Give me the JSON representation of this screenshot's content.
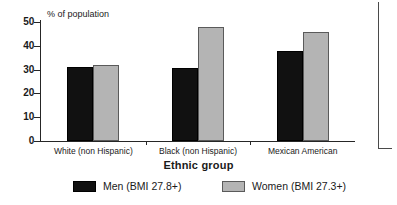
{
  "chart_data": {
    "type": "bar",
    "title": "",
    "xlabel": "Ethnic group",
    "ylabel": "% of population",
    "categories": [
      "White (non Hispanic)",
      "Black (non Hispanic)",
      "Mexican American"
    ],
    "series": [
      {
        "name": "Men (BMI 27.8+)",
        "values": [
          31,
          30.5,
          38
        ],
        "color": "#111111"
      },
      {
        "name": "Women (BMI 27.3+)",
        "values": [
          32,
          48,
          46
        ],
        "color": "#b4b4b4"
      }
    ],
    "ylim": [
      0,
      50
    ],
    "yticks": [
      0,
      10,
      20,
      30,
      40,
      50
    ],
    "ytick_labels": [
      "0",
      "10",
      "20",
      "30",
      "40",
      "50"
    ],
    "grid": false,
    "legend_position": "bottom"
  },
  "legend": {
    "items": [
      {
        "label": "Men (BMI 27.8+)"
      },
      {
        "label": "Women (BMI 27.3+)"
      }
    ]
  }
}
